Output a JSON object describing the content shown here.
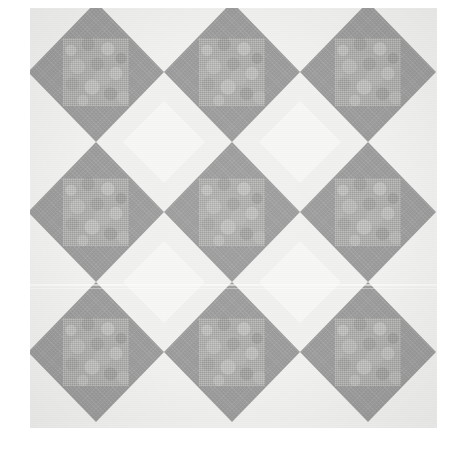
{
  "image": {
    "title": "Quilt block pattern swatch",
    "subject": "square-in-a-square quilt blocks",
    "width": 460,
    "height": 454,
    "background_color": "#ffffff"
  },
  "pattern_area": {
    "left": 30,
    "top": 8,
    "width": 407,
    "height": 420,
    "base_color": "#f2f2f0"
  },
  "grid": {
    "columns": 3,
    "rows": 3,
    "block_width": 136,
    "block_height": 140,
    "offset_x": -2,
    "offset_y": -6
  },
  "block": {
    "name": "square-in-a-square",
    "corner_color": "#f1f1ef",
    "diamond_color": "#9a9a9a",
    "center_color": "#b0b0ae",
    "center_inset_ratio": 0.255
  },
  "joint_diamond": {
    "color": "#f7f7f5",
    "size": 82
  },
  "palette": {
    "paper_white": "#ffffff",
    "light_corner": "#f1f1ef",
    "joint_light": "#f7f7f5",
    "mid_gray": "#9a9a9a",
    "center_mottle_light": "#c4c4c2",
    "center_mottle_dark": "#a0a09e"
  },
  "artifacts": {
    "scan_lines": [
      {
        "top": 284,
        "height": 2,
        "color": "rgba(255,255,255,0.55)"
      },
      {
        "top": 288,
        "height": 1,
        "color": "rgba(255,255,255,0.35)"
      }
    ]
  },
  "blocks": [
    {
      "row": 0,
      "col": 0,
      "name": "block-r1c1"
    },
    {
      "row": 0,
      "col": 1,
      "name": "block-r1c2"
    },
    {
      "row": 0,
      "col": 2,
      "name": "block-r1c3"
    },
    {
      "row": 1,
      "col": 0,
      "name": "block-r2c1"
    },
    {
      "row": 1,
      "col": 1,
      "name": "block-r2c2"
    },
    {
      "row": 1,
      "col": 2,
      "name": "block-r2c3"
    },
    {
      "row": 2,
      "col": 0,
      "name": "block-r3c1"
    },
    {
      "row": 2,
      "col": 1,
      "name": "block-r3c2"
    },
    {
      "row": 2,
      "col": 2,
      "name": "block-r3c3"
    }
  ],
  "joints": [
    {
      "row": 0,
      "col": 0
    },
    {
      "row": 0,
      "col": 1
    },
    {
      "row": 1,
      "col": 0
    },
    {
      "row": 1,
      "col": 1
    }
  ]
}
